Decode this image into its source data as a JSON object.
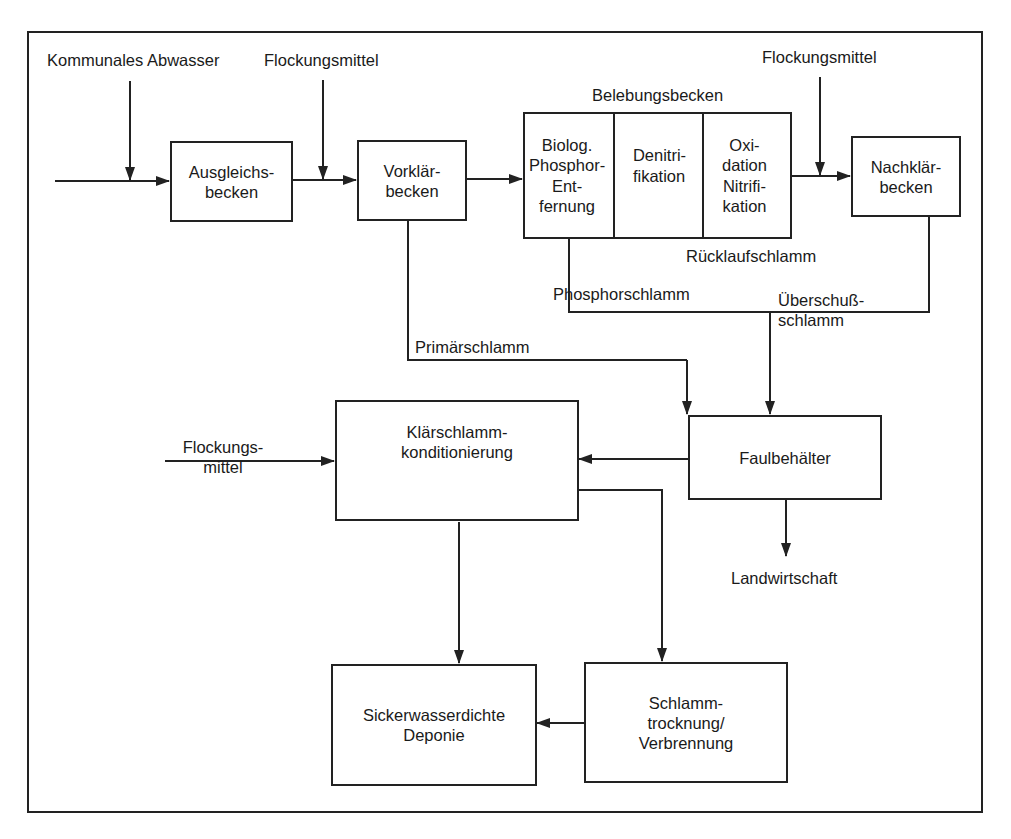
{
  "diagram": {
    "nodes": {
      "ausgleichsbecken": {
        "label": "Ausgleichs-\nbecken"
      },
      "vorklaerbecken": {
        "label": "Vorklär-\nbecken"
      },
      "belebungsbecken": {
        "label": "Belebungsbecken",
        "cells": [
          {
            "label": "Biolog.\nPhosphor-\nEnt-\nfernung"
          },
          {
            "label": "Denitri-\nfikation"
          },
          {
            "label": "Oxi-\ndation\nNitrifi-\nkation"
          }
        ]
      },
      "nachklaerbecken": {
        "label": "Nachklär-\nbecken"
      },
      "faulbehaelter": {
        "label": "Faulbehälter"
      },
      "klaerschlammkonditionierung": {
        "label": "Klärschlamm-\nkonditionierung"
      },
      "deponie": {
        "label": "Sickerwasserdichte\nDeponie"
      },
      "schlammtrocknung": {
        "label": "Schlamm-\ntrocknung/\nVerbrennung"
      }
    },
    "inputs": {
      "kommunales_abwasser": "Kommunales Abwasser",
      "flockungsmittel_1": "Flockungsmittel",
      "flockungsmittel_2": "Flockungsmittel",
      "flockungsmittel_3": "Flockungs-\nmittel"
    },
    "flow_labels": {
      "ruecklaufschlamm": "Rücklaufschlamm",
      "phosphorschlamm": "Phosphorschlamm",
      "ueberschussschlamm": "Überschuß-\nschlamm",
      "primaerschlamm": "Primärschlamm",
      "landwirtschaft": "Landwirtschaft"
    },
    "edges": [
      {
        "from": "Kommunales Abwasser",
        "to": "Ausgleichsbecken"
      },
      {
        "from": "Ausgleichsbecken",
        "to": "Vorklärbecken"
      },
      {
        "from": "Flockungsmittel",
        "to": "Vorklärbecken"
      },
      {
        "from": "Vorklärbecken",
        "to": "Belebungsbecken"
      },
      {
        "from": "Belebungsbecken",
        "to": "Nachklärbecken"
      },
      {
        "from": "Flockungsmittel",
        "to": "Nachklärbecken"
      },
      {
        "from": "Vorklärbecken",
        "to": "Faulbehälter",
        "label": "Primärschlamm"
      },
      {
        "from": "Nachklärbecken",
        "to": "Faulbehälter",
        "label": "Überschußschlamm"
      },
      {
        "from": "Faulbehälter",
        "to": "Klärschlammkonditionierung"
      },
      {
        "from": "Faulbehälter",
        "to": "Landwirtschaft"
      },
      {
        "from": "Flockungsmittel",
        "to": "Klärschlammkonditionierung"
      },
      {
        "from": "Klärschlammkonditionierung",
        "to": "Sickerwasserdichte Deponie"
      },
      {
        "from": "Klärschlammkonditionierung",
        "to": "Schlammtrocknung/Verbrennung"
      },
      {
        "from": "Schlammtrocknung/Verbrennung",
        "to": "Sickerwasserdichte Deponie"
      }
    ]
  }
}
